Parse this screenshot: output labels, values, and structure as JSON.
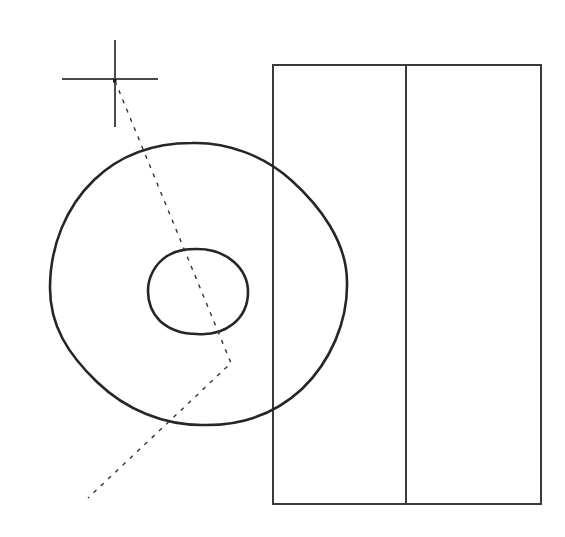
{
  "canvas": {
    "width": 565,
    "height": 537,
    "background_color": "#ffffff",
    "title": "CAD technical drawing viewport"
  },
  "style": {
    "outline_color": "#1a1a1a",
    "thick_stroke_color": "#262626",
    "thin_stroke_color": "#3a3a3a",
    "dashed_stroke_color": "#333333",
    "crosshair_color": "#4a4a4a",
    "thick_stroke_width": "2.6",
    "thin_stroke_width": "1.2",
    "dashed_stroke_width": "1.4",
    "crosshair_stroke_width": "1.5",
    "dash_pattern": "4 6"
  },
  "shapes": {
    "crosshair": {
      "name": "crosshair-cursor",
      "center_x": 115,
      "center_y": 79,
      "h_x1": 62,
      "h_x2": 158,
      "v_y1": 40,
      "v_y2": 127
    },
    "outer_circle": {
      "name": "outer-circle",
      "center_x": 198,
      "center_y": 284,
      "radius_x": 148,
      "radius_y": 141,
      "path": "M 50 288 C 50 208 112 146 192 143 C 272 140 344 204 347 282 C 350 360 284 424 202 425 C 122 426 51 366 50 288 Z"
    },
    "inner_circle": {
      "name": "inner-circle",
      "center_x": 198,
      "center_y": 291,
      "radius": 50,
      "path": "M 148 291 C 148 268 170 249 197 249 C 225 249 248 268 248 292 C 248 316 225 335 197 334 C 170 334 148 315 148 291 Z"
    },
    "rectangle": {
      "name": "rectangle-body",
      "left": 273,
      "top": 65,
      "right": 541,
      "bottom": 504,
      "width": 268,
      "height": 439
    },
    "divider_line": {
      "name": "rectangle-divider-line",
      "x": 406,
      "y1": 65,
      "y2": 504
    },
    "dashed_polyline": {
      "name": "dashed-construction-line",
      "points": "115,81 231,363 88,498",
      "vertex_x": 231,
      "vertex_y": 363,
      "start_x": 115,
      "start_y": 81,
      "end_x": 88,
      "end_y": 498
    }
  }
}
